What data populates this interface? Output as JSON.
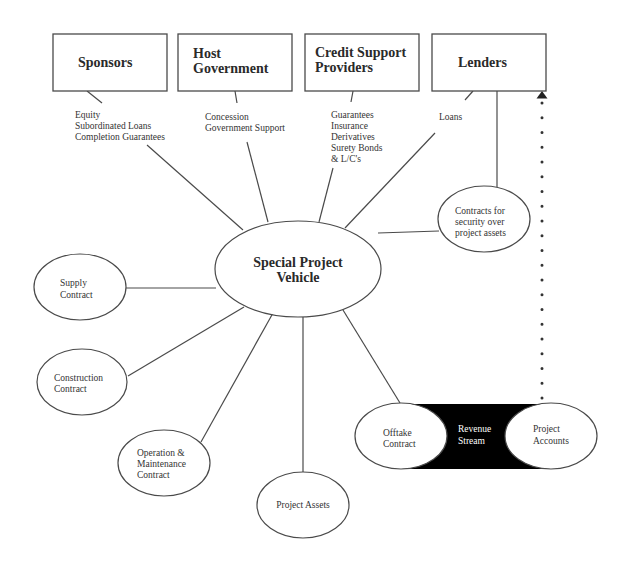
{
  "diagram": {
    "type": "project-finance-structure",
    "center": {
      "label_lines": [
        "Special Project",
        "Vehicle"
      ]
    },
    "parties": {
      "sponsors": {
        "title_lines": [
          "Sponsors"
        ],
        "contributions": [
          "Equity",
          "Subordinated Loans",
          "Completion Guarantees"
        ]
      },
      "host_government": {
        "title_lines": [
          "Host",
          "Government"
        ],
        "contributions": [
          "Concession",
          "Government Support"
        ]
      },
      "credit_support": {
        "title_lines": [
          "Credit Support",
          "Providers"
        ],
        "contributions": [
          "Guarantees",
          "Insurance",
          "Derivatives",
          "Surety Bonds",
          "& L/C's"
        ]
      },
      "lenders": {
        "title_lines": [
          "Lenders"
        ],
        "contributions": [
          "Loans"
        ]
      }
    },
    "contracts": {
      "security": [
        "Contracts for",
        "security over",
        "project assets"
      ],
      "supply": [
        "Supply",
        "Contract"
      ],
      "construction": [
        "Construction",
        "Contract"
      ],
      "om": [
        "Operation &",
        "Maintenance",
        "Contract"
      ],
      "assets": [
        "Project Assets"
      ],
      "offtake": [
        "Offtake",
        "Contract"
      ],
      "accounts": [
        "Project",
        "Accounts"
      ]
    },
    "revenue_stream": [
      "Revenue",
      "Stream"
    ],
    "colors": {
      "line": "#4a4a4a",
      "text": "#333333",
      "revenue_band": "#000000",
      "background": "#ffffff"
    }
  }
}
